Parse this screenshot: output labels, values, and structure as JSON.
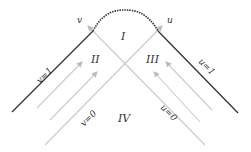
{
  "diagram": {
    "regions": {
      "top": "I",
      "left": "II",
      "right": "III",
      "bottom": "IV"
    },
    "axes": {
      "v_arrow": "v",
      "u_arrow": "u"
    },
    "lines": {
      "left_boundary": "v=1",
      "right_boundary": "u=1",
      "left_null": "v=0",
      "right_null": "u=0"
    },
    "colors": {
      "boundary": "#333333",
      "null_lines": "#c8c8c8",
      "arrows": "#c0c0c0",
      "singularity": "#333333"
    }
  }
}
